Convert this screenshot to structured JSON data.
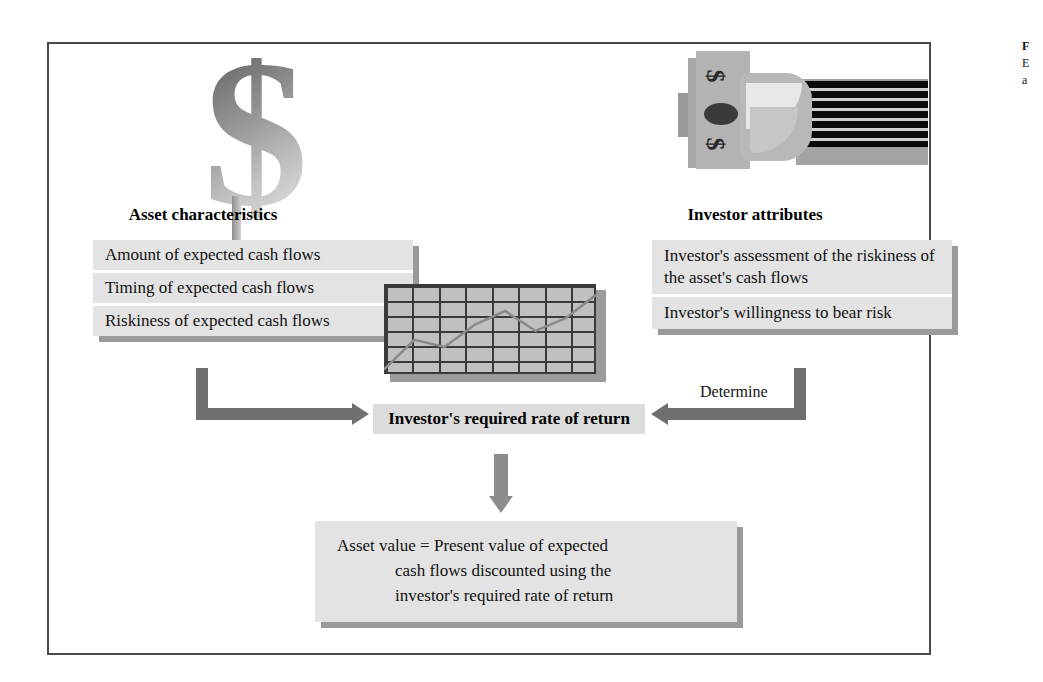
{
  "figure": {
    "caption_fragment_1": "F",
    "caption_fragment_2": "E",
    "caption_fragment_3": "a"
  },
  "graphics": {
    "dollar_symbol": "$",
    "money_symbol_left": "$",
    "money_symbol_right": "$"
  },
  "headings": {
    "left": "Asset characteristics",
    "right": "Investor attributes"
  },
  "asset_panel": {
    "items": [
      "Amount of expected cash flows",
      "Timing of expected cash flows",
      "Riskiness of expected cash flows"
    ]
  },
  "investor_panel": {
    "items": [
      "Investor's assessment of the riskiness of the asset's cash flows",
      "Investor's  willingness  to bear risk"
    ]
  },
  "center": {
    "required_return": "Investor's required rate of return",
    "determine_label": "Determine"
  },
  "formula_panel": {
    "line1": "Asset value = Present value of expected",
    "line2": "cash flows discounted using the",
    "line3": "investor's required rate of return"
  },
  "chart_data": {
    "type": "line",
    "title": "",
    "xlabel": "",
    "ylabel": "",
    "grid": true,
    "legend": "none",
    "x": [
      0,
      1,
      2,
      3,
      4,
      5,
      6,
      7
    ],
    "values": [
      5,
      38,
      30,
      55,
      70,
      48,
      62,
      88
    ],
    "ylim": [
      0,
      100
    ]
  },
  "colors": {
    "panel_fill": "#e3e3e3",
    "panel_shadow": "#9a9a9a",
    "arrow": "#6f6f6f",
    "center_bar": "#dcdcdc",
    "frame_border": "#4a4a4a",
    "money_stripe": "#0a0a0a"
  }
}
